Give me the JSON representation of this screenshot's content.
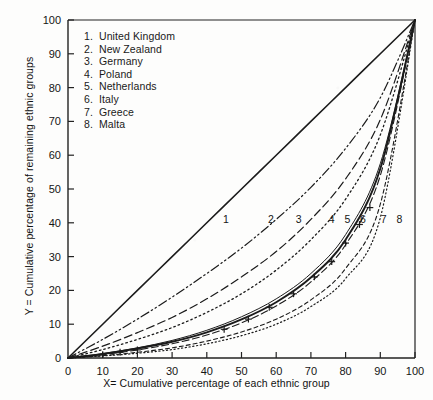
{
  "figure": {
    "axis_label_x": "X= Cumulative percentage of  each ethnic group",
    "axis_label_y": "Y = Cumulative percentage of remaining ethnic groups"
  },
  "legend": {
    "items": [
      {
        "num": "1.",
        "label": "United Kingdom"
      },
      {
        "num": "2.",
        "label": "New Zealand"
      },
      {
        "num": "3.",
        "label": "Germany"
      },
      {
        "num": "4.",
        "label": "Poland"
      },
      {
        "num": "5.",
        "label": "Netherlands"
      },
      {
        "num": "6.",
        "label": "Italy"
      },
      {
        "num": "7.",
        "label": "Greece"
      },
      {
        "num": "8.",
        "label": "Malta"
      }
    ]
  },
  "ticks": {
    "x": [
      "0",
      "10",
      "20",
      "30",
      "40",
      "50",
      "60",
      "70",
      "80",
      "90",
      "100"
    ],
    "y": [
      "0",
      "10",
      "20",
      "30",
      "40",
      "50",
      "60",
      "70",
      "80",
      "90",
      "100"
    ]
  },
  "curve_tags": [
    {
      "text": "1",
      "x": 45.5,
      "y": 40.0
    },
    {
      "text": "2",
      "x": 58.5,
      "y": 40.0
    },
    {
      "text": "3",
      "x": 66.5,
      "y": 40.0
    },
    {
      "text": "4",
      "x": 76.0,
      "y": 40.0
    },
    {
      "text": "5",
      "x": 80.5,
      "y": 40.0
    },
    {
      "text": "6",
      "x": 85.0,
      "y": 40.0
    },
    {
      "text": "7",
      "x": 91.0,
      "y": 40.0
    },
    {
      "text": "8",
      "x": 95.5,
      "y": 40.0
    }
  ],
  "chart_data": {
    "type": "line",
    "title": "",
    "xlabel": "X= Cumulative percentage of  each ethnic group",
    "ylabel": "Y = Cumulative percentage of remaining ethnic groups",
    "xlim": [
      0,
      100
    ],
    "ylim": [
      0,
      100
    ],
    "xticks": [
      0,
      10,
      20,
      30,
      40,
      50,
      60,
      70,
      80,
      90,
      100
    ],
    "yticks": [
      0,
      10,
      20,
      30,
      40,
      50,
      60,
      70,
      80,
      90,
      100
    ],
    "grid": false,
    "legend_position": "upper-left-inside",
    "x": [
      0,
      10,
      20,
      30,
      40,
      50,
      60,
      70,
      80,
      90,
      100
    ],
    "series": [
      {
        "name": "equality-line",
        "label": "Line of equality",
        "style": "solid",
        "values": [
          0,
          10,
          20,
          30,
          40,
          50,
          60,
          70,
          80,
          90,
          100
        ]
      },
      {
        "name": "United Kingdom",
        "tag": "1",
        "style": "dash-dot-dot",
        "values": [
          0,
          5.5,
          11.5,
          18.0,
          25.0,
          32.5,
          41.0,
          50.5,
          62.0,
          77.0,
          100
        ]
      },
      {
        "name": "New Zealand",
        "tag": "2",
        "style": "long-dash",
        "values": [
          0,
          3.5,
          7.5,
          12.0,
          17.5,
          24.0,
          31.5,
          41.0,
          53.0,
          70.5,
          100
        ]
      },
      {
        "name": "Germany",
        "tag": "3",
        "style": "dotted",
        "values": [
          0,
          2.5,
          5.5,
          9.0,
          13.5,
          19.0,
          26.0,
          35.0,
          47.0,
          66.0,
          100
        ]
      },
      {
        "name": "Poland",
        "tag": "4",
        "style": "solid-thin",
        "values": [
          0,
          1.3,
          3.0,
          5.2,
          8.2,
          12.2,
          17.5,
          25.0,
          36.5,
          57.5,
          100
        ]
      },
      {
        "name": "Netherlands",
        "tag": "5",
        "style": "solid-thick",
        "values": [
          0,
          1.2,
          2.8,
          4.8,
          7.6,
          11.4,
          16.5,
          23.8,
          35.0,
          56.0,
          100
        ]
      },
      {
        "name": "Italy",
        "tag": "6",
        "style": "dash-plus-markers",
        "marker": "plus",
        "values": [
          0,
          1.0,
          2.4,
          4.2,
          6.8,
          10.4,
          15.4,
          22.5,
          33.5,
          54.0,
          100
        ],
        "marker_points": [
          {
            "x": 10,
            "y": 1.0
          },
          {
            "x": 15,
            "y": 1.7
          },
          {
            "x": 20,
            "y": 2.4
          },
          {
            "x": 45,
            "y": 8.5
          },
          {
            "x": 52,
            "y": 11.5
          },
          {
            "x": 58,
            "y": 15.0
          },
          {
            "x": 65,
            "y": 19.0
          },
          {
            "x": 71,
            "y": 24.0
          },
          {
            "x": 76,
            "y": 28.5
          },
          {
            "x": 80,
            "y": 34.0
          },
          {
            "x": 84,
            "y": 39.5
          },
          {
            "x": 87,
            "y": 44.5
          }
        ]
      },
      {
        "name": "Greece",
        "tag": "7",
        "style": "short-dash",
        "values": [
          0,
          0.7,
          1.7,
          3.0,
          5.0,
          7.7,
          11.5,
          17.2,
          26.5,
          45.5,
          100
        ]
      },
      {
        "name": "Malta",
        "tag": "8",
        "style": "fine-dotted",
        "values": [
          0,
          0.6,
          1.4,
          2.5,
          4.2,
          6.6,
          10.0,
          15.2,
          23.5,
          41.5,
          100
        ]
      }
    ]
  }
}
